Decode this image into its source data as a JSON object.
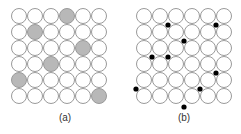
{
  "panels": [
    {
      "label": "(a)",
      "grid": {
        "rows": 6,
        "cols": 6,
        "origin_x": 19,
        "origin_y": 16,
        "spacing": 16,
        "radius": 7.5
      },
      "shaded_cells": [
        [
          0,
          3
        ],
        [
          1,
          1
        ],
        [
          2,
          4
        ],
        [
          3,
          2
        ],
        [
          4,
          0
        ],
        [
          5,
          5
        ]
      ],
      "shade_color": "#b8b8b8"
    },
    {
      "label": "(b)",
      "grid": {
        "rows": 6,
        "cols": 6,
        "origin_x": 144,
        "origin_y": 16,
        "spacing": 16,
        "radius": 7.5
      },
      "dots": [
        [
          168,
          25
        ],
        [
          216,
          25
        ],
        [
          184,
          41
        ],
        [
          152,
          57
        ],
        [
          168,
          57
        ],
        [
          216,
          73
        ],
        [
          136,
          89
        ],
        [
          200,
          89
        ],
        [
          184,
          107
        ]
      ],
      "dot_color": "#000000"
    }
  ],
  "colors": {
    "circle_stroke": "#9a9a9a",
    "circle_fill": "#ffffff"
  }
}
